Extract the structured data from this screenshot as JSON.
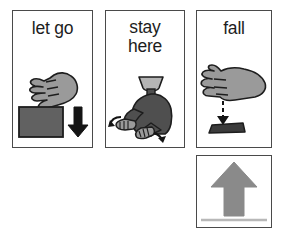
{
  "board": {
    "background_color": "#ffffff",
    "card_border_color": "#4a4a4a",
    "layout": "three cards in a top row, one card below the third"
  },
  "palette": {
    "skin_gray": "#9a9a9a",
    "object_dark_gray": "#616161",
    "body_dark_gray": "#4f4f4f",
    "arrow_black": "#141414",
    "arrow_gray": "#8a8a8a",
    "ground_line_gray": "#b8b8b8",
    "outline_black": "#1d1d1d",
    "text_color": "#1d1d1d"
  },
  "cards": [
    {
      "id": "let-go",
      "label": "let go",
      "symbol_name": "hand-releasing-block-with-down-arrow",
      "elements": [
        "hand",
        "square block",
        "downward arrow"
      ]
    },
    {
      "id": "stay-here",
      "label": "stay here",
      "label_lines": [
        "stay",
        "here"
      ],
      "symbol_name": "person-gesturing-stay-with-curved-arrows",
      "elements": [
        "person torso",
        "two outstretched hands",
        "two curved arrows"
      ]
    },
    {
      "id": "fall",
      "label": "fall",
      "symbol_name": "hand-dropping-object-with-dashed-down-arrow",
      "elements": [
        "hand",
        "dashed downward arrow",
        "fallen object"
      ]
    },
    {
      "id": "up-arrow",
      "label": "",
      "symbol_name": "up-arrow-above-ground-line",
      "elements": [
        "large upward arrow",
        "horizontal ground line"
      ]
    }
  ]
}
